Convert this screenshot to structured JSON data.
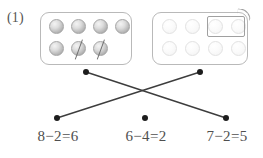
{
  "worksheet": {
    "problem_number": "(1)",
    "boxes": [
      {
        "name": "left-counter-box",
        "total": 7,
        "rows": [
          [
            {
              "style": "solid",
              "crossed": false
            },
            {
              "style": "solid",
              "crossed": false
            },
            {
              "style": "solid",
              "crossed": false
            },
            {
              "style": "solid",
              "crossed": false
            }
          ],
          [
            {
              "style": "solid",
              "crossed": false
            },
            {
              "style": "solid",
              "crossed": true
            },
            {
              "style": "solid",
              "crossed": true
            }
          ]
        ],
        "grouped": false
      },
      {
        "name": "right-counter-box",
        "total": 8,
        "rows": [
          [
            {
              "style": "faint",
              "crossed": false
            },
            {
              "style": "faint",
              "crossed": false
            },
            {
              "style": "faint",
              "crossed": false
            },
            {
              "style": "faint",
              "crossed": false
            }
          ],
          [
            {
              "style": "faint",
              "crossed": false
            },
            {
              "style": "faint",
              "crossed": false
            },
            {
              "style": "faint",
              "crossed": false
            },
            {
              "style": "faint",
              "crossed": false
            }
          ]
        ],
        "grouped": true,
        "group_ring_count": 2
      }
    ],
    "equations": [
      {
        "text": "8−2=6",
        "minuend": 8,
        "subtrahend": 2,
        "difference": 6
      },
      {
        "text": "6−4=2",
        "minuend": 6,
        "subtrahend": 4,
        "difference": 2
      },
      {
        "text": "7−2=5",
        "minuend": 7,
        "subtrahend": 2,
        "difference": 5
      }
    ],
    "connector_dots": [
      {
        "name": "dot-left-box",
        "x": 86,
        "y": 72
      },
      {
        "name": "dot-right-box",
        "x": 200,
        "y": 72
      },
      {
        "name": "dot-equation-0",
        "x": 57,
        "y": 118
      },
      {
        "name": "dot-equation-1",
        "x": 145,
        "y": 118
      },
      {
        "name": "dot-equation-2",
        "x": 226,
        "y": 118
      }
    ],
    "connector_lines": [
      {
        "name": "line-left-box-to-equation-2",
        "from": "dot-left-box",
        "to": "dot-equation-2"
      },
      {
        "name": "line-right-box-to-equation-0",
        "from": "dot-right-box",
        "to": "dot-equation-0"
      }
    ],
    "colors": {
      "line": "#3d3d3d",
      "dot": "#1d1d1d",
      "box_border": "#b9b9b9",
      "text": "#4f4f4f"
    }
  }
}
